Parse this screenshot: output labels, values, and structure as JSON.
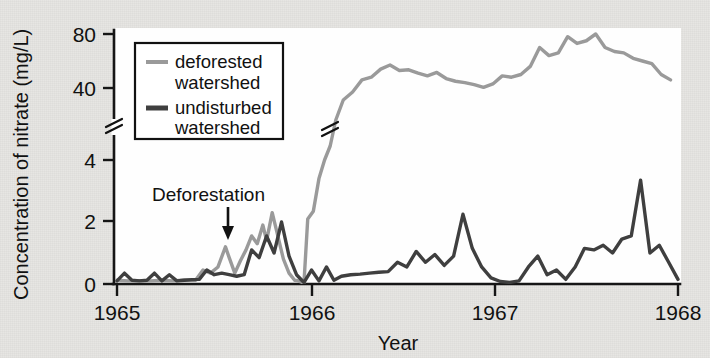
{
  "figure": {
    "background_color": "#e7e6e3",
    "plot_background_color": "#fefefe"
  },
  "chart_data": {
    "type": "line",
    "title": "",
    "xlabel": "Year",
    "ylabel": "Concentration of nitrate (mg/L)",
    "x_ticklabels": [
      "1965",
      "1966",
      "1967",
      "1968"
    ],
    "x_tickvalues": [
      1965,
      1966,
      1967,
      1968
    ],
    "xlim": [
      1965,
      1968
    ],
    "y_ticklabels": [
      "0",
      "2",
      "4",
      "40",
      "80"
    ],
    "y_tickvalues": [
      0,
      2,
      4,
      40,
      80
    ],
    "y_axis_broken": true,
    "y_break_between": [
      4,
      40
    ],
    "grid": false,
    "legend_position": "upper left",
    "annotations": [
      {
        "text": "Deforestation",
        "x": 1965.61,
        "y": 3.1,
        "arrow_to_y": 1.35
      }
    ],
    "series": [
      {
        "name": "deforested watershed",
        "color": "#9a9a9a",
        "legend_label_line1": "deforested",
        "legend_label_line2": "watershed",
        "x": [
          1965.0,
          1965.06,
          1965.12,
          1965.18,
          1965.24,
          1965.3,
          1965.36,
          1965.42,
          1965.46,
          1965.5,
          1965.54,
          1965.58,
          1965.6,
          1965.63,
          1965.66,
          1965.69,
          1965.72,
          1965.75,
          1965.78,
          1965.8,
          1965.83,
          1965.86,
          1965.89,
          1965.92,
          1965.95,
          1965.97,
          1965.99,
          1966.0,
          1966.02,
          1966.05,
          1966.08,
          1966.11,
          1966.14,
          1966.17,
          1966.21,
          1966.26,
          1966.31,
          1966.36,
          1966.41,
          1966.46,
          1966.51,
          1966.56,
          1966.61,
          1966.66,
          1966.71,
          1966.76,
          1966.81,
          1966.86,
          1966.91,
          1966.96,
          1967.01,
          1967.06,
          1967.11,
          1967.16,
          1967.21,
          1967.26,
          1967.31,
          1967.36,
          1967.41,
          1967.46,
          1967.51,
          1967.56,
          1967.61,
          1967.66,
          1967.71,
          1967.76,
          1967.81,
          1967.86,
          1967.91,
          1967.96
        ],
        "y": [
          0.12,
          0.1,
          0.11,
          0.1,
          0.12,
          0.1,
          0.13,
          0.12,
          0.45,
          0.35,
          0.55,
          1.2,
          0.85,
          0.35,
          0.75,
          1.1,
          1.55,
          1.3,
          1.9,
          1.4,
          2.3,
          1.55,
          0.8,
          0.35,
          0.12,
          0.1,
          0.05,
          0.05,
          2.1,
          2.35,
          3.4,
          4.0,
          11.0,
          24.0,
          34.0,
          38.0,
          46.0,
          48.0,
          54.0,
          57.0,
          53.0,
          53.5,
          51.0,
          49.0,
          51.5,
          47.0,
          45.0,
          44.0,
          42.5,
          40.5,
          43.0,
          49.0,
          48.0,
          50.0,
          56.0,
          70.0,
          64.0,
          66.0,
          78.0,
          73.0,
          75.0,
          80.0,
          70.0,
          67.0,
          66.0,
          62.0,
          60.0,
          58.0,
          50.0,
          46.0
        ]
      },
      {
        "name": "undisturbed watershed",
        "color": "#3f3f3f",
        "legend_label_line1": "undisturbed",
        "legend_label_line2": "watershed",
        "x": [
          1965.0,
          1965.04,
          1965.08,
          1965.12,
          1965.16,
          1965.2,
          1965.24,
          1965.28,
          1965.32,
          1965.36,
          1965.4,
          1965.44,
          1965.48,
          1965.52,
          1965.56,
          1965.6,
          1965.64,
          1965.68,
          1965.72,
          1965.76,
          1965.8,
          1965.84,
          1965.88,
          1965.92,
          1965.96,
          1966.0,
          1966.04,
          1966.08,
          1966.12,
          1966.16,
          1966.2,
          1966.25,
          1966.3,
          1966.35,
          1966.4,
          1966.45,
          1966.5,
          1966.55,
          1966.6,
          1966.65,
          1966.7,
          1966.75,
          1966.8,
          1966.85,
          1966.9,
          1966.95,
          1967.0,
          1967.05,
          1967.1,
          1967.15,
          1967.2,
          1967.25,
          1967.3,
          1967.35,
          1967.4,
          1967.45,
          1967.5,
          1967.55,
          1967.6,
          1967.65,
          1967.7,
          1967.75,
          1967.8,
          1967.85,
          1967.9,
          1967.95,
          1968.0
        ],
        "y": [
          0.1,
          0.35,
          0.12,
          0.1,
          0.12,
          0.35,
          0.1,
          0.3,
          0.1,
          0.12,
          0.14,
          0.15,
          0.45,
          0.3,
          0.35,
          0.3,
          0.25,
          0.3,
          1.1,
          0.85,
          1.55,
          1.0,
          2.0,
          0.9,
          0.3,
          0.05,
          0.45,
          0.1,
          0.55,
          0.12,
          0.25,
          0.3,
          0.32,
          0.35,
          0.38,
          0.4,
          0.7,
          0.55,
          1.05,
          0.7,
          0.95,
          0.6,
          0.9,
          2.25,
          1.15,
          0.55,
          0.2,
          0.08,
          0.05,
          0.1,
          0.55,
          0.9,
          0.3,
          0.45,
          0.15,
          0.55,
          1.15,
          1.1,
          1.25,
          1.0,
          1.45,
          1.55,
          3.35,
          1.0,
          1.25,
          0.7,
          0.15
        ]
      }
    ]
  }
}
